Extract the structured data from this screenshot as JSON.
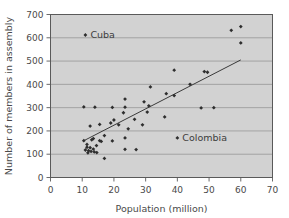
{
  "chart_data": {
    "type": "scatter",
    "title": "",
    "xlabel": "Population (million)",
    "ylabel": "Number of members in assembly",
    "xlim": [
      0,
      70
    ],
    "ylim": [
      0,
      700
    ],
    "xticks": [
      0,
      10,
      20,
      30,
      40,
      50,
      60,
      70
    ],
    "yticks": [
      0,
      100,
      200,
      300,
      400,
      500,
      600,
      700
    ],
    "grid": "horizontal",
    "legend": "none",
    "plot_background": "#d2d2d2",
    "point_color": "#2e2e2e",
    "trendline_color": "#3a3a3a",
    "trendline": {
      "x": [
        10.5,
        60.0
      ],
      "y": [
        158,
        505
      ]
    },
    "annotations": [
      {
        "label": "Cuba",
        "x": 11,
        "y": 612
      },
      {
        "label": "Colombia",
        "x": 40,
        "y": 170
      }
    ],
    "points": [
      {
        "x": 11,
        "y": 612
      },
      {
        "x": 57,
        "y": 632
      },
      {
        "x": 60,
        "y": 648
      },
      {
        "x": 60,
        "y": 578
      },
      {
        "x": 39,
        "y": 461
      },
      {
        "x": 48.5,
        "y": 455
      },
      {
        "x": 49.5,
        "y": 452
      },
      {
        "x": 44,
        "y": 400
      },
      {
        "x": 31.5,
        "y": 389
      },
      {
        "x": 36.5,
        "y": 360
      },
      {
        "x": 39,
        "y": 352
      },
      {
        "x": 23.5,
        "y": 337
      },
      {
        "x": 29.5,
        "y": 325
      },
      {
        "x": 31,
        "y": 308
      },
      {
        "x": 10.5,
        "y": 303
      },
      {
        "x": 14,
        "y": 302
      },
      {
        "x": 19.5,
        "y": 301
      },
      {
        "x": 23.5,
        "y": 302
      },
      {
        "x": 47.5,
        "y": 299
      },
      {
        "x": 51.5,
        "y": 300
      },
      {
        "x": 30.5,
        "y": 281
      },
      {
        "x": 23,
        "y": 278
      },
      {
        "x": 36,
        "y": 260
      },
      {
        "x": 26.5,
        "y": 250
      },
      {
        "x": 20,
        "y": 247
      },
      {
        "x": 12.5,
        "y": 221
      },
      {
        "x": 19,
        "y": 234
      },
      {
        "x": 15.5,
        "y": 228
      },
      {
        "x": 21.5,
        "y": 226
      },
      {
        "x": 29,
        "y": 226
      },
      {
        "x": 24.5,
        "y": 209
      },
      {
        "x": 17,
        "y": 180
      },
      {
        "x": 13.5,
        "y": 167
      },
      {
        "x": 13,
        "y": 162
      },
      {
        "x": 23.5,
        "y": 170
      },
      {
        "x": 40,
        "y": 170
      },
      {
        "x": 10.5,
        "y": 158
      },
      {
        "x": 15.5,
        "y": 158
      },
      {
        "x": 16,
        "y": 155
      },
      {
        "x": 19.5,
        "y": 157
      },
      {
        "x": 11.5,
        "y": 142
      },
      {
        "x": 14.5,
        "y": 137
      },
      {
        "x": 11.5,
        "y": 130
      },
      {
        "x": 12.5,
        "y": 128
      },
      {
        "x": 13.5,
        "y": 122
      },
      {
        "x": 23.5,
        "y": 121
      },
      {
        "x": 27,
        "y": 120
      },
      {
        "x": 11,
        "y": 118
      },
      {
        "x": 12,
        "y": 115
      },
      {
        "x": 12.8,
        "y": 112
      },
      {
        "x": 13.8,
        "y": 110
      },
      {
        "x": 14.6,
        "y": 107
      },
      {
        "x": 11.8,
        "y": 106
      },
      {
        "x": 17,
        "y": 82
      }
    ]
  }
}
